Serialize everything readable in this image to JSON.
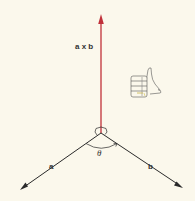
{
  "diagram": {
    "labels": {
      "cross_product": "a x b",
      "vector_a": "a",
      "vector_b": "b",
      "angle": "θ"
    },
    "colors": {
      "background": "#fbf8ec",
      "cross_vector": "#c0303a",
      "vectors": "#2a2a2a",
      "text": "#333333"
    },
    "elements": {
      "origin": [
        101,
        133
      ],
      "cross_arrow_tip": [
        101,
        15
      ],
      "a_arrow_tip": [
        20,
        190
      ],
      "b_arrow_tip": [
        183,
        188
      ],
      "right_angle_marker": "at origin between a x b and plane",
      "angle_arc": "theta between a and b",
      "hand_icon": "right hand thumbs-up"
    }
  }
}
